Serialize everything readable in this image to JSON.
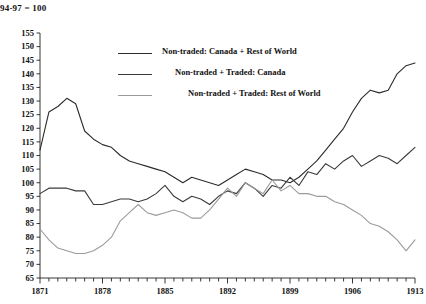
{
  "chart_data": {
    "type": "line",
    "title": "94-97 = 100",
    "xlabel": "",
    "ylabel": "",
    "xlim": [
      1871,
      1913
    ],
    "ylim": [
      65,
      155
    ],
    "ytick_step": 5,
    "grid": false,
    "legend_position": "upper-center",
    "yticks": [
      65,
      70,
      75,
      80,
      85,
      90,
      95,
      100,
      105,
      110,
      115,
      120,
      125,
      130,
      135,
      140,
      145,
      150,
      155
    ],
    "xticks_labeled": [
      1871,
      1878,
      1885,
      1892,
      1899,
      1906,
      1913
    ],
    "x": [
      1871,
      1872,
      1873,
      1874,
      1875,
      1876,
      1877,
      1878,
      1879,
      1880,
      1881,
      1882,
      1883,
      1884,
      1885,
      1886,
      1887,
      1888,
      1889,
      1890,
      1891,
      1892,
      1893,
      1894,
      1895,
      1896,
      1897,
      1898,
      1899,
      1900,
      1901,
      1902,
      1903,
      1904,
      1905,
      1906,
      1907,
      1908,
      1909,
      1910,
      1911,
      1912,
      1913
    ],
    "series": [
      {
        "name": "Non-traded: Canada + Rest of World",
        "color": "#2b2b2b",
        "width": 1.1,
        "values": [
          112,
          126,
          128,
          131,
          129,
          119,
          116,
          114,
          113,
          110,
          108,
          107,
          106,
          105,
          104,
          102,
          100,
          102,
          101,
          100,
          99,
          101,
          103,
          105,
          104,
          103,
          101,
          101,
          100,
          102,
          105,
          108,
          112,
          116,
          120,
          126,
          131,
          134,
          133,
          134,
          140,
          143,
          144
        ]
      },
      {
        "name": "Non-traded + Traded: Canada",
        "color": "#3a3a3a",
        "width": 1.1,
        "values": [
          96,
          98,
          98,
          98,
          97,
          97,
          92,
          92,
          93,
          94,
          94,
          93,
          94,
          96,
          99,
          95,
          93,
          95,
          94,
          92,
          95,
          97,
          96,
          100,
          98,
          95,
          99,
          98,
          102,
          99,
          104,
          103,
          107,
          105,
          108,
          110,
          106,
          108,
          110,
          109,
          107,
          110,
          113
        ]
      },
      {
        "name": "Non-traded + Traded: Rest of World",
        "color": "#9b9b9b",
        "width": 1.1,
        "values": [
          83,
          79,
          76,
          75,
          74,
          74,
          75,
          77,
          80,
          86,
          89,
          92,
          89,
          88,
          89,
          90,
          89,
          87,
          87,
          90,
          94,
          98,
          95,
          100,
          98,
          96,
          101,
          97,
          99,
          96,
          96,
          95,
          95,
          93,
          92,
          90,
          88,
          85,
          84,
          82,
          79,
          75,
          79
        ]
      }
    ]
  }
}
